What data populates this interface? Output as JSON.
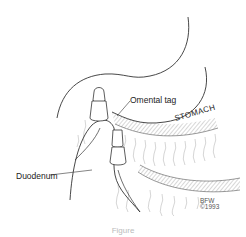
{
  "figure": {
    "labels": {
      "omental_tag": "Omental tag",
      "stomach": "STOMACH",
      "duodenum": "Duodenum"
    },
    "signature": {
      "initials": "BFW",
      "year": "©1993"
    },
    "caption": "Figure"
  },
  "colors": {
    "line": "#333333",
    "hatch": "#777777",
    "texture": "#aaaaaa",
    "background": "#ffffff"
  }
}
